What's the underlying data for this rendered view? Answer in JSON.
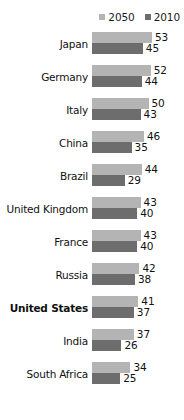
{
  "chart_data": {
    "type": "bar",
    "orientation": "horizontal",
    "title": "",
    "subtitle": "",
    "xlabel": "",
    "ylabel": "",
    "grid": false,
    "legend_position": "top-right",
    "xlim": [
      0,
      60
    ],
    "categories": [
      "Japan",
      "Germany",
      "Italy",
      "China",
      "Brazil",
      "United Kingdom",
      "France",
      "Russia",
      "United States",
      "India",
      "South Africa"
    ],
    "highlighted_category": "United States",
    "series": [
      {
        "name": "2050",
        "color": "#b4b4b4",
        "values": [
          53,
          52,
          50,
          46,
          44,
          43,
          43,
          42,
          41,
          37,
          34
        ]
      },
      {
        "name": "2010",
        "color": "#6d6d6d",
        "values": [
          45,
          44,
          43,
          35,
          29,
          40,
          40,
          38,
          37,
          26,
          25
        ]
      }
    ]
  },
  "legend": {
    "items": [
      {
        "label": "2050",
        "color": "#b4b4b4"
      },
      {
        "label": "2010",
        "color": "#6d6d6d"
      }
    ]
  },
  "rows": [
    {
      "label": "Japan",
      "bold": false,
      "v2050": 53,
      "v2010": 45
    },
    {
      "label": "Germany",
      "bold": false,
      "v2050": 52,
      "v2010": 44
    },
    {
      "label": "Italy",
      "bold": false,
      "v2050": 50,
      "v2010": 43
    },
    {
      "label": "China",
      "bold": false,
      "v2050": 46,
      "v2010": 35
    },
    {
      "label": "Brazil",
      "bold": false,
      "v2050": 44,
      "v2010": 29
    },
    {
      "label": "United Kingdom",
      "bold": false,
      "v2050": 43,
      "v2010": 40
    },
    {
      "label": "France",
      "bold": false,
      "v2050": 43,
      "v2010": 40
    },
    {
      "label": "Russia",
      "bold": false,
      "v2050": 42,
      "v2010": 38
    },
    {
      "label": "United States",
      "bold": true,
      "v2050": 41,
      "v2010": 37
    },
    {
      "label": "India",
      "bold": false,
      "v2050": 37,
      "v2010": 26
    },
    {
      "label": "South Africa",
      "bold": false,
      "v2050": 34,
      "v2010": 25
    }
  ],
  "scale": {
    "px_per_unit": 1.13,
    "zero_px": 0,
    "value_gap_px": 3
  }
}
